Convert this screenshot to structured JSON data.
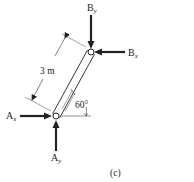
{
  "figure": {
    "caption": "(c)",
    "member": {
      "name": "two-force member AB",
      "length_label": "3 m",
      "angle_label": "60°"
    },
    "forces": {
      "By": {
        "main": "B",
        "sub": "y",
        "direction": "down"
      },
      "Bx": {
        "main": "B",
        "sub": "x",
        "direction": "left"
      },
      "Ax": {
        "main": "A",
        "sub": "x",
        "direction": "right"
      },
      "Ay": {
        "main": "A",
        "sub": "y",
        "direction": "up"
      }
    },
    "colors": {
      "line": "#222222",
      "background": "#ffffff"
    }
  }
}
